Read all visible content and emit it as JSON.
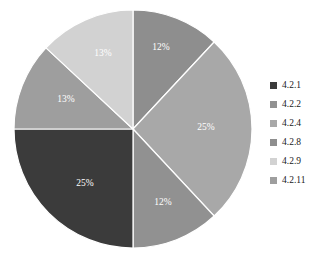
{
  "chart_data": {
    "type": "pie",
    "title": "",
    "labels": [
      "4.2.1",
      "4.2.2",
      "4.2.4",
      "4.2.8",
      "4.2.9",
      "4.2.11"
    ],
    "values": [
      25,
      12,
      25,
      12,
      13,
      13
    ],
    "value_labels": [
      "25%",
      "12%",
      "25%",
      "12%",
      "13%",
      "13%"
    ],
    "colors": [
      "#3b3b3b",
      "#919191",
      "#a8a8a8",
      "#8e8e8e",
      "#d2d2d2",
      "#9e9e9e"
    ],
    "legend_position": "right",
    "slice_label_color": "#ffffff",
    "start_angle_deg": 0,
    "direction": "clockwise",
    "background": "#ffffff",
    "slices": [
      {
        "label": "4.2.8",
        "value": 12,
        "display": "12%",
        "color": "#8e8e8e",
        "start_deg": 0,
        "end_deg": 43,
        "label_x": 161,
        "label_y": 48
      },
      {
        "label": "4.2.4",
        "value": 25,
        "display": "25%",
        "color": "#a8a8a8",
        "start_deg": 43,
        "end_deg": 137,
        "label_x": 206,
        "label_y": 128
      },
      {
        "label": "4.2.2",
        "value": 12,
        "display": "12%",
        "color": "#919191",
        "start_deg": 137,
        "end_deg": 180,
        "label_x": 163,
        "label_y": 203
      },
      {
        "label": "4.2.1",
        "value": 25,
        "display": "25%",
        "color": "#3b3b3b",
        "start_deg": 180,
        "end_deg": 270,
        "label_x": 85,
        "label_y": 184
      },
      {
        "label": "4.2.11",
        "value": 13,
        "display": "13%",
        "color": "#9e9e9e",
        "start_deg": 270,
        "end_deg": 313,
        "label_x": 66,
        "label_y": 100
      },
      {
        "label": "4.2.9",
        "value": 13,
        "display": "13%",
        "color": "#d2d2d2",
        "start_deg": 313,
        "end_deg": 360,
        "label_x": 103,
        "label_y": 54
      }
    ],
    "geometry": {
      "cx": 133,
      "cy": 129,
      "r": 119
    }
  },
  "legend": {
    "items": [
      {
        "label": "4.2.1",
        "color": "#3b3b3b"
      },
      {
        "label": "4.2.2",
        "color": "#919191"
      },
      {
        "label": "4.2.4",
        "color": "#a8a8a8"
      },
      {
        "label": "4.2.8",
        "color": "#8e8e8e"
      },
      {
        "label": "4.2.9",
        "color": "#d2d2d2"
      },
      {
        "label": "4.2.11",
        "color": "#9e9e9e"
      }
    ]
  }
}
